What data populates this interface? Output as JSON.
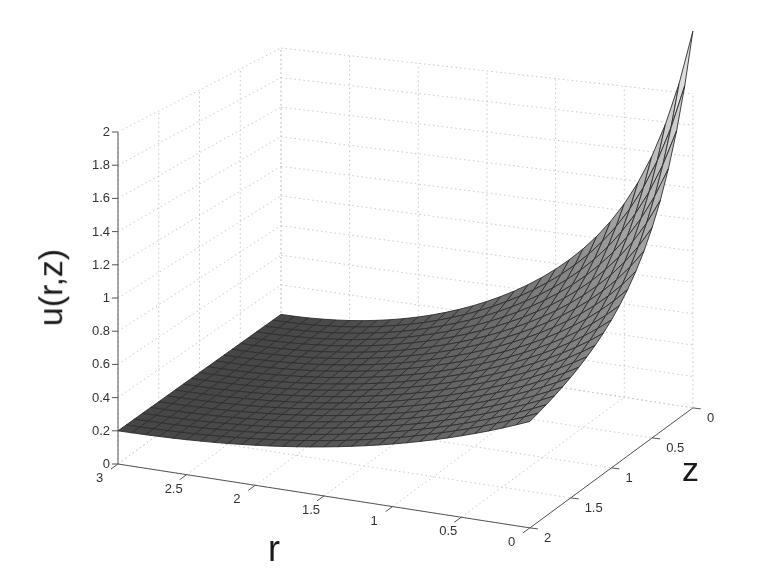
{
  "chart_data": {
    "type": "surface",
    "title": "",
    "xlabel": "r",
    "ylabel": "z",
    "zlabel": "u(r,z)",
    "x_ticks": [
      "0",
      "0.5",
      "1",
      "1.5",
      "2",
      "2.5",
      "3"
    ],
    "x_tick_values": [
      0,
      0.5,
      1,
      1.5,
      2,
      2.5,
      3
    ],
    "y_ticks": [
      "0",
      "0.5",
      "1",
      "1.5",
      "2"
    ],
    "y_tick_values": [
      0,
      0.5,
      1,
      1.5,
      2
    ],
    "z_ticks": [
      "0",
      "0.2",
      "0.4",
      "0.6",
      "0.8",
      "1",
      "1.2",
      "1.4",
      "1.6",
      "1.8",
      "2"
    ],
    "z_tick_values": [
      0,
      0.2,
      0.4,
      0.6,
      0.8,
      1.0,
      1.2,
      1.4,
      1.6,
      1.8,
      2.0
    ],
    "xlim": [
      0,
      3
    ],
    "ylim": [
      0,
      2
    ],
    "zlim": [
      0,
      2
    ],
    "grid": true,
    "colormap": "gray",
    "mesh": {
      "r_points": 31,
      "z_points": 21
    },
    "approx_values": {
      "description": "u(r,z) sampled at r = 0,0.5,...,3 (rows) and z = 0,0.5,...,2 (cols)",
      "r": [
        0,
        0.5,
        1,
        1.5,
        2,
        2.5,
        3
      ],
      "z": [
        0,
        0.5,
        1,
        1.5,
        2
      ],
      "u": [
        [
          2.3,
          1.25,
          0.7,
          0.45,
          0.3
        ],
        [
          1.75,
          1.2,
          0.72,
          0.45,
          0.3
        ],
        [
          1.35,
          1.05,
          0.7,
          0.45,
          0.3
        ],
        [
          1.0,
          0.85,
          0.62,
          0.42,
          0.28
        ],
        [
          0.72,
          0.62,
          0.5,
          0.36,
          0.25
        ],
        [
          0.45,
          0.42,
          0.36,
          0.28,
          0.22
        ],
        [
          0.2,
          0.2,
          0.2,
          0.2,
          0.2
        ]
      ]
    },
    "peak": {
      "r": 0,
      "z": 0,
      "u": 2.3
    }
  }
}
